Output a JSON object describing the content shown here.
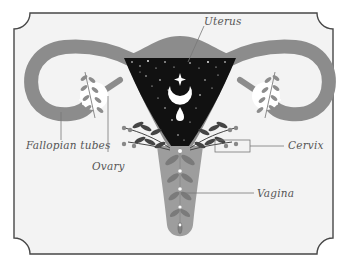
{
  "diagram": {
    "labels": {
      "uterus": "Uterus",
      "fallopian_tubes": "Fallopian tubes",
      "ovary": "Ovary",
      "cervix": "Cervix",
      "vagina": "Vagina"
    },
    "symbols": {
      "moon": "crescent-moon",
      "star": "four-point-star",
      "drop": "blood-drop"
    },
    "colors": {
      "page_bg": "#ffffff",
      "card_bg": "#f3f3f3",
      "frame": "#474747",
      "organ_gray": "#8c8c8c",
      "vagina_gray": "#9d9d9d",
      "leaf_dark": "#555555",
      "uterus_night": "#111111",
      "ovary": "#ffffff",
      "leader_line": "#777777"
    }
  }
}
